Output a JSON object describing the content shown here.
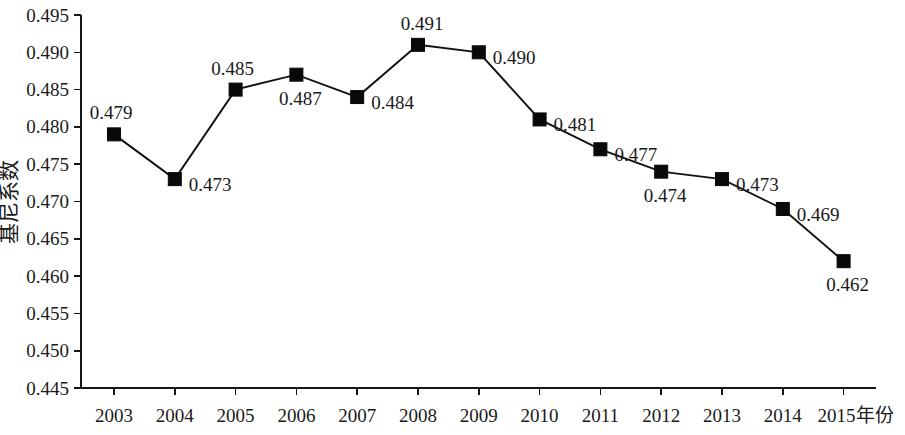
{
  "chart_data": {
    "type": "line",
    "title": "",
    "xlabel": "年份",
    "ylabel": "基尼系数",
    "categories": [
      "2003",
      "2004",
      "2005",
      "2006",
      "2007",
      "2008",
      "2009",
      "2010",
      "2011",
      "2012",
      "2013",
      "2014",
      "2015"
    ],
    "values": [
      0.479,
      0.473,
      0.485,
      0.487,
      0.484,
      0.491,
      0.49,
      0.481,
      0.477,
      0.474,
      0.473,
      0.469,
      0.462
    ],
    "point_labels": [
      "0.479",
      "0.473",
      "0.485",
      "0.487",
      "0.484",
      "0.491",
      "0.490",
      "0.481",
      "0.477",
      "0.474",
      "0.473",
      "0.469",
      "0.462"
    ],
    "label_positions": [
      "above-left",
      "right",
      "above-left",
      "below",
      "right",
      "above",
      "right",
      "right",
      "right",
      "below",
      "right",
      "right",
      "below"
    ],
    "ylim": [
      0.445,
      0.495
    ],
    "ytick_step": 0.005,
    "ytick_labels": [
      "0.495",
      "0.490",
      "0.485",
      "0.480",
      "0.475",
      "0.470",
      "0.465",
      "0.460",
      "0.455",
      "0.450",
      "0.445"
    ],
    "xtick_labels": [
      "2003",
      "2004",
      "2005",
      "2006",
      "2007",
      "2008",
      "2009",
      "2010",
      "2011",
      "2012",
      "2013",
      "2014",
      "2015年份"
    ],
    "grid": false,
    "legend": false,
    "legend_position": "none",
    "marker": "square",
    "series_color": "#111111",
    "marker_color": "#090909",
    "axis_color": "#171717",
    "background_color": "#ffffff"
  }
}
